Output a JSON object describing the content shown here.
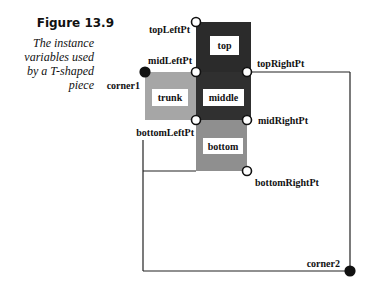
{
  "figure": {
    "title": "Figure 13.9",
    "caption": "The instance variables used by a T-shaped piece",
    "caption_lines": [
      "The instance",
      "variables used",
      "by a T-shaped",
      "piece"
    ]
  },
  "colors": {
    "dark_block": "#2b2b2b",
    "trunk_block": "#a6a6a6",
    "bottom_block": "#8f8f8f",
    "label_box": "#ffffff",
    "line": "#222222"
  },
  "blocks": [
    {
      "id": "top",
      "label": "top"
    },
    {
      "id": "middle",
      "label": "middle"
    },
    {
      "id": "trunk",
      "label": "trunk"
    },
    {
      "id": "bottom",
      "label": "bottom"
    }
  ],
  "points": [
    {
      "id": "topLeftPt",
      "label": "topLeftPt",
      "style": "hollow"
    },
    {
      "id": "midLeftPt",
      "label": "midLeftPt",
      "style": "hollow"
    },
    {
      "id": "topRightPt",
      "label": "topRightPt",
      "style": "hollow"
    },
    {
      "id": "midRightPt",
      "label": "midRightPt",
      "style": "hollow"
    },
    {
      "id": "bottomLeftPt",
      "label": "bottomLeftPt",
      "style": "hollow"
    },
    {
      "id": "bottomRightPt",
      "label": "bottomRightPt",
      "style": "hollow"
    },
    {
      "id": "corner1",
      "label": "corner1",
      "style": "filled"
    },
    {
      "id": "corner2",
      "label": "corner2",
      "style": "filled"
    }
  ]
}
